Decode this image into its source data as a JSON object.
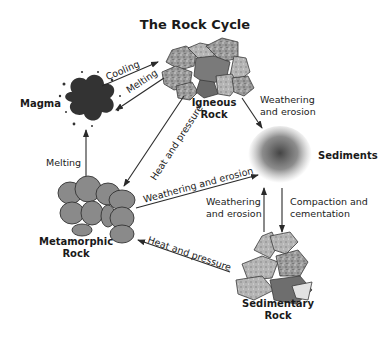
{
  "title": "The Rock Cycle",
  "nodes": {
    "magma": {
      "label": "Magma"
    },
    "igneous": {
      "line1": "Igneous",
      "line2": "Rock"
    },
    "sediments": {
      "label": "Sediments"
    },
    "metamorphic": {
      "line1": "Metamorphic",
      "line2": "Rock"
    },
    "sedimentary": {
      "line1": "Sedimentary",
      "line2": "Rock"
    }
  },
  "arrows": {
    "magma_to_igneous": "Cooling",
    "igneous_to_magma": "Melting",
    "igneous_to_metamorphic": "Heat and pressure",
    "igneous_to_sediments": {
      "line1": "Weathering",
      "line2": "and erosion"
    },
    "metamorphic_to_magma": "Melting",
    "metamorphic_to_sediments": "Weathering and erosion",
    "sedimentary_to_sediments": {
      "line1": "Weathering",
      "line2": "and erosion"
    },
    "sediments_to_sedimentary": {
      "line1": "Compaction and",
      "line2": "cementation"
    },
    "sedimentary_to_metamorphic": "Heat and pressure"
  },
  "colors": {
    "text": "#222222",
    "arrow": "#2a2a2a",
    "rock_fill": "#8e8e8e",
    "rock_stroke": "#3a3a3a",
    "magma": "#3a3a3a",
    "sediment": "#555555"
  }
}
